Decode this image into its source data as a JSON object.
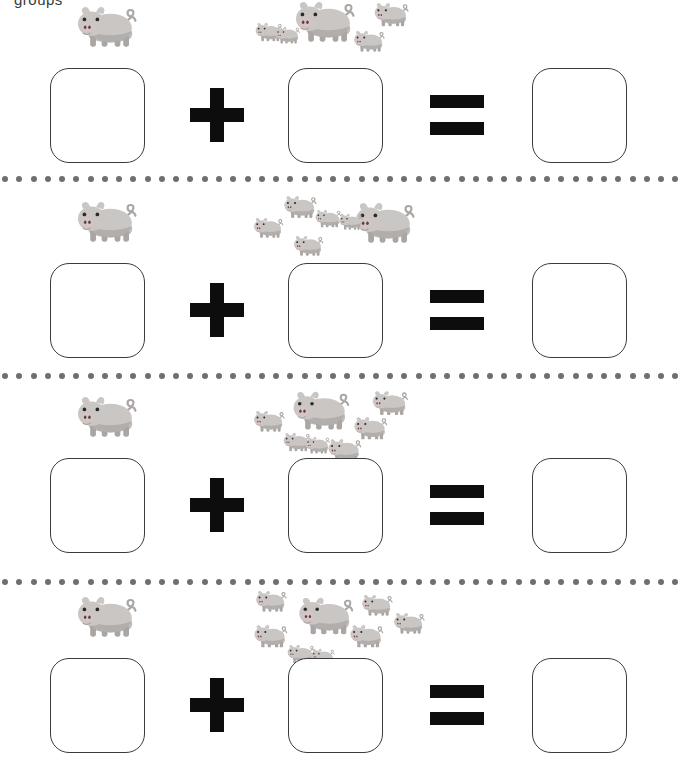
{
  "worksheet": {
    "header_text": "groups",
    "page_background": "#ffffff",
    "box_border_color": "#3b3b3b",
    "operator_color": "#0d0d0d",
    "divider_dot_color": "#6f6f6f",
    "pig_body_color": "#c9c6c4",
    "pig_shade_color": "#a9a6a4",
    "pig_snout_color": "#d9c3c3",
    "pig_eye_color": "#2b2b2b"
  },
  "symbols": {
    "plus": "+",
    "equals": "=",
    "pig": "pig-icon",
    "dot": "dot-icon"
  },
  "problems": [
    {
      "index": 1,
      "left_count": 1,
      "right_count": 5,
      "sum": 6,
      "left_answer": "",
      "right_answer": "",
      "total_answer": "",
      "operator": "+",
      "equals": "=",
      "group_layout": [
        {
          "x": 2,
          "y": 22,
          "s": 0.46,
          "flip": false
        },
        {
          "x": 22,
          "y": 26,
          "s": 0.42,
          "flip": false
        },
        {
          "x": 38,
          "y": 0,
          "s": 1.0,
          "flip": false
        },
        {
          "x": 120,
          "y": 2,
          "s": 0.58,
          "flip": false
        },
        {
          "x": 100,
          "y": 30,
          "s": 0.52,
          "flip": false
        }
      ]
    },
    {
      "index": 2,
      "left_count": 1,
      "right_count": 6,
      "sum": 7,
      "left_answer": "",
      "right_answer": "",
      "total_answer": "",
      "operator": "+",
      "equals": "=",
      "group_layout": [
        {
          "x": 30,
          "y": 0,
          "s": 0.55,
          "flip": false
        },
        {
          "x": 0,
          "y": 22,
          "s": 0.5,
          "flip": false
        },
        {
          "x": 62,
          "y": 14,
          "s": 0.44,
          "flip": false
        },
        {
          "x": 40,
          "y": 40,
          "s": 0.5,
          "flip": false
        },
        {
          "x": 98,
          "y": 6,
          "s": 1.0,
          "flip": false
        },
        {
          "x": 86,
          "y": 18,
          "s": 0.4,
          "flip": false
        }
      ]
    },
    {
      "index": 3,
      "left_count": 1,
      "right_count": 7,
      "sum": 8,
      "left_answer": "",
      "right_answer": "",
      "total_answer": "",
      "operator": "+",
      "equals": "=",
      "group_layout": [
        {
          "x": 0,
          "y": 20,
          "s": 0.52,
          "flip": false
        },
        {
          "x": 36,
          "y": 0,
          "s": 0.95,
          "flip": false
        },
        {
          "x": 118,
          "y": 0,
          "s": 0.6,
          "flip": false
        },
        {
          "x": 30,
          "y": 42,
          "s": 0.46,
          "flip": false
        },
        {
          "x": 52,
          "y": 46,
          "s": 0.42,
          "flip": false
        },
        {
          "x": 100,
          "y": 26,
          "s": 0.56,
          "flip": false
        },
        {
          "x": 74,
          "y": 48,
          "s": 0.56,
          "flip": false
        }
      ]
    },
    {
      "index": 4,
      "left_count": 1,
      "right_count": 8,
      "sum": 9,
      "left_answer": "",
      "right_answer": "",
      "total_answer": "",
      "operator": "+",
      "equals": "=",
      "group_layout": [
        {
          "x": 2,
          "y": 0,
          "s": 0.52,
          "flip": false
        },
        {
          "x": 0,
          "y": 34,
          "s": 0.56,
          "flip": false
        },
        {
          "x": 42,
          "y": 6,
          "s": 0.92,
          "flip": false
        },
        {
          "x": 34,
          "y": 54,
          "s": 0.46,
          "flip": false
        },
        {
          "x": 108,
          "y": 4,
          "s": 0.52,
          "flip": false
        },
        {
          "x": 96,
          "y": 34,
          "s": 0.56,
          "flip": false
        },
        {
          "x": 140,
          "y": 22,
          "s": 0.52,
          "flip": false
        },
        {
          "x": 58,
          "y": 58,
          "s": 0.4,
          "flip": false
        }
      ]
    }
  ],
  "layout": {
    "row_tops": [
      0,
      195,
      390,
      590
    ],
    "divider_tops": [
      175,
      372,
      578
    ],
    "dots_per_divider": 48
  }
}
